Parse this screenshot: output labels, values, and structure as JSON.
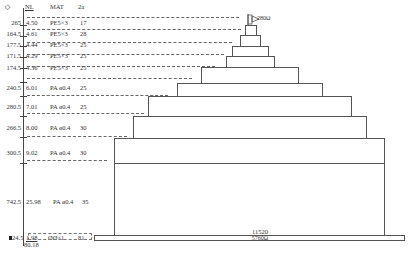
{
  "header": {
    "col_elev_icon": "diamond-symbol",
    "col_elev": "◇",
    "col_nl": "NL",
    "col_mat": "MAT",
    "col_thickness": "2a"
  },
  "rows": [
    {
      "elev": "265",
      "nl": "4.50",
      "mat": "PE5×3",
      "t": "17"
    },
    {
      "elev": "164.5",
      "nl": "4.61",
      "mat": "PE5×3",
      "t": "28"
    },
    {
      "elev": "177.5",
      "nl": "4.44",
      "mat": "PE5×3",
      "t": "25"
    },
    {
      "elev": "171.5",
      "nl": "4.29",
      "mat": "PE5×3",
      "t": "25"
    },
    {
      "elev": "174.5",
      "nl": "4.36",
      "mat": "PE5×3",
      "t": "25"
    },
    {
      "elev": "240.5",
      "nl": "6.01",
      "mat": "PA ø0.4",
      "t": "25"
    },
    {
      "elev": "280.5",
      "nl": "7.01",
      "mat": "PA ø0.4",
      "t": "25"
    },
    {
      "elev": "266.5",
      "nl": "8.00",
      "mat": "PA ø0.4",
      "t": "30"
    },
    {
      "elev": "300.5",
      "nl": "9.02",
      "mat": "PA ø0.4",
      "t": "30"
    },
    {
      "elev": "742.5",
      "nl": "25.98",
      "mat": "PA ø0.4",
      "t": "35"
    }
  ],
  "bottom_row": {
    "elev": "24.5",
    "nl": "1.98",
    "mat": "ØØ×1",
    "t": "81",
    "sub_label": "80.18"
  },
  "flag": {
    "icon": "flag-icon",
    "label": "280Ω"
  },
  "base": {
    "width_label": "11520",
    "resistance_label": "5760Ω"
  },
  "colors": {
    "line": "#555555",
    "dash": "#666666",
    "text": "#333333",
    "background": "#ffffff"
  }
}
